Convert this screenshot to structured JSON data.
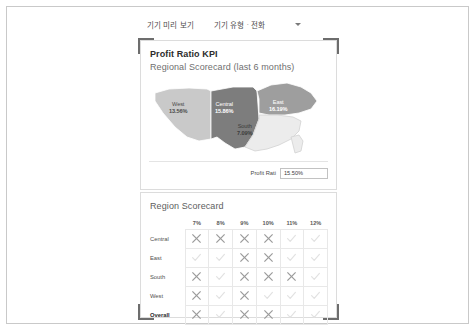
{
  "toolbar": {
    "device_preview_label": "기기 미리 보기",
    "device_type_label": "기기 유형",
    "separator": "·",
    "device_type_value": "전화",
    "caret_icon": "chevron-down-icon"
  },
  "dashboard": {
    "kpi": {
      "title": "Profit Ratio KPI",
      "subtitle": "Regional Scorecard (last 6 months)",
      "map": {
        "regions": [
          {
            "key": "west",
            "name": "West",
            "value": "13.56%",
            "fill": "#c9c9c9",
            "text_color": "#4b4b4b"
          },
          {
            "key": "central",
            "name": "Central",
            "value": "15.86%",
            "fill": "#7d7d7d",
            "text_color": "#ffffff"
          },
          {
            "key": "east",
            "name": "East",
            "value": "16.19%",
            "fill": "#9e9e9e",
            "text_color": "#ffffff"
          },
          {
            "key": "south",
            "name": "South",
            "value": "7.09%",
            "fill": "#ececec",
            "text_color": "#3c3c3c"
          }
        ]
      },
      "profit_ratio_control": {
        "label": "Profit Rati",
        "value": "15.50%"
      }
    },
    "scorecard": {
      "title": "Region Scorecard",
      "columns": [
        "7%",
        "8%",
        "9%",
        "10%",
        "11%",
        "12%"
      ],
      "rows": [
        {
          "label": "Central",
          "marks": [
            "x",
            "x",
            "x",
            "x",
            "check",
            "check"
          ]
        },
        {
          "label": "East",
          "marks": [
            "check",
            "check",
            "x",
            "x",
            "check",
            "check"
          ]
        },
        {
          "label": "South",
          "marks": [
            "x",
            "check",
            "x",
            "x",
            "x",
            "check"
          ]
        },
        {
          "label": "West",
          "marks": [
            "x",
            "check",
            "x",
            "check",
            "check",
            "check"
          ]
        },
        {
          "label": "Overall",
          "marks": [
            "x",
            "check",
            "x",
            "x",
            "check",
            "check"
          ]
        }
      ]
    }
  },
  "colors": {
    "frame_border": "#6d6d6d",
    "panel_border": "#dcdcdc",
    "mark_x": "#9a9a9a",
    "mark_check": "#e2e2e2"
  }
}
